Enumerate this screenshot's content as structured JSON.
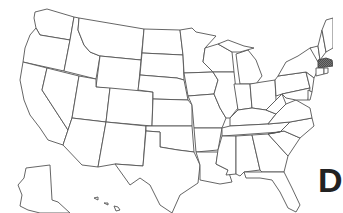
{
  "map": {
    "title": "United States outline map",
    "highlighted_state": "Massachusetts",
    "highlight_color": "#555555",
    "outline_color": "#555555",
    "background": "#ffffff",
    "partial_letter": "D",
    "states": [
      "Washington",
      "Oregon",
      "California",
      "Idaho",
      "Nevada",
      "Montana",
      "Wyoming",
      "Utah",
      "Arizona",
      "Colorado",
      "New Mexico",
      "North Dakota",
      "South Dakota",
      "Nebraska",
      "Kansas",
      "Oklahoma",
      "Texas",
      "Minnesota",
      "Iowa",
      "Missouri",
      "Arkansas",
      "Louisiana",
      "Wisconsin",
      "Illinois",
      "Michigan",
      "Indiana",
      "Ohio",
      "Kentucky",
      "Tennessee",
      "Mississippi",
      "Alabama",
      "Georgia",
      "Florida",
      "South Carolina",
      "North Carolina",
      "Virginia",
      "West Virginia",
      "Pennsylvania",
      "New York",
      "Vermont",
      "New Hampshire",
      "Maine",
      "Massachusetts",
      "Connecticut",
      "Rhode Island",
      "New Jersey",
      "Delaware",
      "Maryland",
      "Alaska",
      "Hawaii"
    ]
  }
}
